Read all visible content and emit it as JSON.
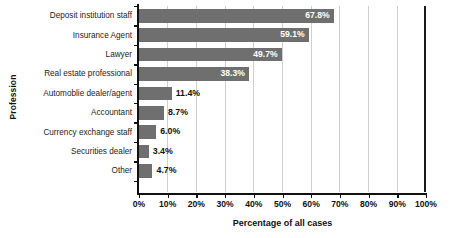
{
  "chart_data": {
    "type": "bar",
    "orientation": "horizontal",
    "title": "",
    "xlabel": "Percentage of all cases",
    "ylabel": "Profession",
    "categories": [
      "Deposit institution staff",
      "Insurance Agent",
      "Lawyer",
      "Real estate professional",
      "Automoblie dealer/agent",
      "Accountant",
      "Currency exchange staff",
      "Securities dealer",
      "Other"
    ],
    "values": [
      67.8,
      59.1,
      49.7,
      38.3,
      11.4,
      8.7,
      6.0,
      3.4,
      4.7
    ],
    "value_labels": [
      "67.8%",
      "59.1%",
      "49.7%",
      "38.3%",
      "11.4%",
      "8.7%",
      "6.0%",
      "3.4%",
      "4.7%"
    ],
    "label_placement": [
      "inside",
      "inside",
      "inside",
      "inside",
      "outside",
      "outside",
      "outside",
      "outside",
      "outside"
    ],
    "xlim": [
      0,
      100
    ],
    "xticks": [
      0,
      10,
      20,
      30,
      40,
      50,
      60,
      70,
      80,
      90,
      100
    ],
    "xtick_labels": [
      "0%",
      "10%",
      "20%",
      "30%",
      "40%",
      "50%",
      "60%",
      "70%",
      "80%",
      "90%",
      "100%"
    ],
    "grid": "vertical",
    "legend": "none",
    "bar_color": "#6f6f6f",
    "inside_label_color": "#ffffff",
    "outside_label_color": "#111111",
    "gridline_color": "#cfcfcf",
    "axis_color": "#111111",
    "background": "#ffffff"
  }
}
